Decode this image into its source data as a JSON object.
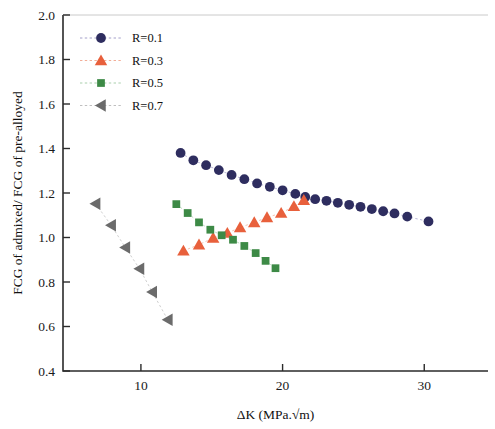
{
  "chart_data": {
    "type": "scatter",
    "title": "",
    "xlabel": "ΔK (MPa.√m)",
    "ylabel": "FCG of admixed/ FCG of pre-alloyed",
    "xlim": [
      4.5,
      34.5
    ],
    "ylim": [
      0.4,
      2.0
    ],
    "xticks": [
      10,
      20,
      30
    ],
    "xticklabels": [
      "10",
      "20",
      "30"
    ],
    "yticks": [
      0.4,
      0.6,
      0.8,
      1.0,
      1.2,
      1.4,
      1.6,
      1.8,
      2.0
    ],
    "yticklabels": [
      "0.4",
      "0.6",
      "0.8",
      "1.0",
      "1.2",
      "1.4",
      "1.6",
      "1.8",
      "2.0"
    ],
    "grid": false,
    "legend_position": "top-left",
    "series": [
      {
        "name": "R=0.1",
        "marker": "circle",
        "color": "#2e2d5f",
        "line_color": "#9a95c4",
        "x": [
          12.8,
          13.7,
          14.6,
          15.5,
          16.4,
          17.3,
          18.2,
          19.1,
          20.0,
          20.9,
          21.6,
          22.3,
          23.1,
          23.9,
          24.7,
          25.5,
          26.3,
          27.1,
          27.9,
          28.8,
          30.3
        ],
        "y": [
          1.38,
          1.347,
          1.325,
          1.303,
          1.281,
          1.262,
          1.243,
          1.228,
          1.212,
          1.196,
          1.182,
          1.172,
          1.165,
          1.156,
          1.147,
          1.138,
          1.128,
          1.118,
          1.108,
          1.094,
          1.072
        ]
      },
      {
        "name": "R=0.3",
        "marker": "triangle-up",
        "color": "#e8603c",
        "line_color": "#f0a58c",
        "x": [
          13.0,
          14.1,
          15.1,
          16.1,
          17.0,
          18.0,
          18.9,
          19.9,
          20.8,
          21.5
        ],
        "y": [
          0.94,
          0.968,
          0.998,
          1.02,
          1.045,
          1.068,
          1.09,
          1.11,
          1.14,
          1.168
        ]
      },
      {
        "name": "R=0.5",
        "marker": "square",
        "color": "#3d8a46",
        "line_color": "#9fc9a3",
        "x": [
          12.5,
          13.3,
          14.1,
          14.9,
          15.7,
          16.5,
          17.3,
          18.1,
          18.8,
          19.5
        ],
        "y": [
          1.15,
          1.11,
          1.068,
          1.035,
          1.01,
          0.99,
          0.962,
          0.93,
          0.895,
          0.862
        ]
      },
      {
        "name": "R=0.7",
        "marker": "triangle-left",
        "color": "#6b6b6b",
        "line_color": "#b8b8b8",
        "x": [
          6.8,
          7.9,
          8.9,
          9.9,
          10.8,
          11.9
        ],
        "y": [
          1.152,
          1.055,
          0.955,
          0.86,
          0.755,
          0.63
        ]
      }
    ]
  },
  "legend": {
    "items": [
      {
        "label": "R=0.1"
      },
      {
        "label": "R=0.3"
      },
      {
        "label": "R=0.5"
      },
      {
        "label": "R=0.7"
      }
    ]
  }
}
